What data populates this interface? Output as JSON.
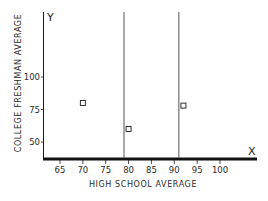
{
  "chart_data": {
    "type": "scatter",
    "title": "",
    "xlabel": "HIGH SCHOOL AVERAGE",
    "ylabel": "COLLEGE FRESHMAN AVERAGE",
    "x_axis_letter": "X",
    "y_axis_letter": "Y",
    "x_ticks": [
      65,
      70,
      75,
      80,
      85,
      90,
      95,
      100
    ],
    "y_ticks": [
      50,
      75,
      100
    ],
    "xlim": [
      61.5,
      108
    ],
    "ylim": [
      35,
      135
    ],
    "grid": false,
    "legend": null,
    "points": [
      {
        "x": 70,
        "y": 80
      },
      {
        "x": 80,
        "y": 60
      },
      {
        "x": 92,
        "y": 78
      }
    ],
    "vertical_lines": [
      79,
      91
    ],
    "marker": "open-square"
  },
  "colors": {
    "ink": "#1a1a1a",
    "background": "#ffffff",
    "vline": "#555555"
  }
}
